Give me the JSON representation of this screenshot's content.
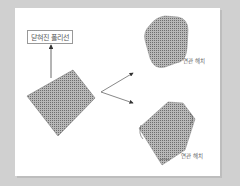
{
  "diagram": {
    "title_box": "닫혀진 폴리선",
    "labels": [
      {
        "text": "연관 해치",
        "position": "upper-right"
      },
      {
        "text": "연관 해치",
        "position": "lower-right"
      }
    ],
    "colors": {
      "background": "#d0d0d0",
      "canvas": "#ffffff",
      "hatch": "#8a8a8a",
      "arrow": "#444444"
    },
    "shapes": [
      {
        "name": "closed-polyline-quad",
        "kind": "hatched-quadrilateral"
      },
      {
        "name": "rounded-hatch",
        "kind": "hatched-rounded-polygon"
      },
      {
        "name": "clipped-hatch",
        "kind": "hatched-polygon-with-corner-marks"
      }
    ]
  }
}
